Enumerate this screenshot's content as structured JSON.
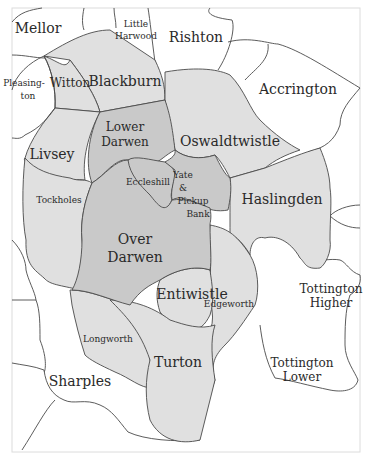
{
  "map": {
    "title": "Townships around Blackburn and Darwen",
    "colors": {
      "background": "#ffffff",
      "outer_township": "#ffffff",
      "inner_township": "#e0e0e0",
      "core_township": "#c9c9c9",
      "boundary": "#4a4a4a"
    },
    "labels": {
      "mellor": "Mellor",
      "little_harwood_1": "Little",
      "little_harwood_2": "Harwood",
      "rishton": "Rishton",
      "pleasington_1": "Pleasing-",
      "pleasington_2": "ton",
      "witton": "Witton",
      "blackburn": "Blackburn",
      "accrington": "Accrington",
      "lower_darwen_1": "Lower",
      "lower_darwen_2": "Darwen",
      "oswaldtwistle": "Oswaldtwistle",
      "livsey": "Livsey",
      "eccleshill": "Eccleshill",
      "yate_1": "Yate",
      "yate_2": "&",
      "yate_3": "Pickup",
      "yate_4": "Bank",
      "haslingden": "Haslingden",
      "tockholes": "Tockholes",
      "over_darwen_1": "Over",
      "over_darwen_2": "Darwen",
      "entiwistle": "Entiwistle",
      "edgeworth": "Edgeworth",
      "tottington_higher_1": "Tottington",
      "tottington_higher_2": "Higher",
      "longworth": "Longworth",
      "turton": "Turton",
      "sharples": "Sharples",
      "tottington_lower_1": "Tottington",
      "tottington_lower_2": "Lower"
    }
  }
}
